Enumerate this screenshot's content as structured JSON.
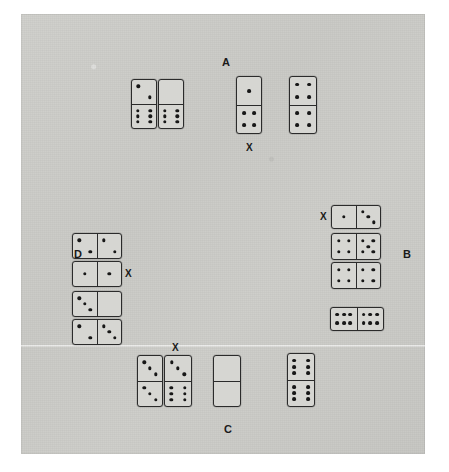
{
  "figure": {
    "background_color": "#c9c9c5",
    "tile_color": "#d6d6d2",
    "pip_color": "#171717",
    "border_color": "#2b2b2b"
  },
  "labels": [
    {
      "id": "label-a",
      "text": "A",
      "x": 222,
      "y": 57
    },
    {
      "id": "label-b",
      "text": "B",
      "x": 403,
      "y": 249
    },
    {
      "id": "label-c",
      "text": "C",
      "x": 224,
      "y": 424
    },
    {
      "id": "label-d",
      "text": "D",
      "x": 74,
      "y": 249
    }
  ],
  "x_marks": [
    {
      "id": "x-mark-a",
      "text": "X",
      "x": 246,
      "y": 143
    },
    {
      "id": "x-mark-b",
      "text": "X",
      "x": 320,
      "y": 212
    },
    {
      "id": "x-mark-c",
      "text": "X",
      "x": 172,
      "y": 343
    },
    {
      "id": "x-mark-d",
      "text": "X",
      "x": 125,
      "y": 269
    }
  ],
  "groups": [
    {
      "id": "group-a",
      "label": "A",
      "orientation": "vertical",
      "dominoes": [
        {
          "id": "a-1",
          "top": 2,
          "bottom": 6,
          "x": 131,
          "y": 79,
          "w": 26,
          "h": 50,
          "marked": false
        },
        {
          "id": "a-2",
          "top": 0,
          "bottom": 6,
          "x": 158,
          "y": 79,
          "w": 26,
          "h": 50,
          "marked": false
        },
        {
          "id": "a-3",
          "top": 1,
          "bottom": 4,
          "x": 236,
          "y": 76,
          "w": 26,
          "h": 58,
          "marked": true
        },
        {
          "id": "a-4",
          "top": 4,
          "bottom": 4,
          "x": 289,
          "y": 76,
          "w": 28,
          "h": 58,
          "marked": false
        }
      ]
    },
    {
      "id": "group-b",
      "label": "B",
      "orientation": "horizontal",
      "dominoes": [
        {
          "id": "b-1",
          "left": 1,
          "right": 3,
          "x": 331,
          "y": 205,
          "w": 50,
          "h": 24,
          "marked": true
        },
        {
          "id": "b-2",
          "left": 4,
          "right": 5,
          "x": 331,
          "y": 233,
          "w": 50,
          "h": 27,
          "marked": false
        },
        {
          "id": "b-3",
          "left": 4,
          "right": 4,
          "x": 331,
          "y": 262,
          "w": 50,
          "h": 27,
          "marked": false
        },
        {
          "id": "b-4",
          "left": 6,
          "right": 6,
          "x": 330,
          "y": 307,
          "w": 54,
          "h": 24,
          "marked": false
        }
      ]
    },
    {
      "id": "group-d",
      "label": "D",
      "orientation": "horizontal",
      "dominoes": [
        {
          "id": "d-1",
          "left": 2,
          "right": 2,
          "x": 72,
          "y": 233,
          "w": 50,
          "h": 26,
          "marked": false
        },
        {
          "id": "d-2",
          "left": 1,
          "right": 1,
          "x": 72,
          "y": 261,
          "w": 50,
          "h": 26,
          "marked": true
        },
        {
          "id": "d-3",
          "left": 3,
          "right": 0,
          "x": 72,
          "y": 291,
          "w": 50,
          "h": 26,
          "marked": false
        },
        {
          "id": "d-4",
          "left": 2,
          "right": 3,
          "x": 72,
          "y": 319,
          "w": 50,
          "h": 26,
          "marked": false
        }
      ]
    },
    {
      "id": "group-c",
      "label": "C",
      "orientation": "vertical",
      "dominoes": [
        {
          "id": "c-1",
          "top": 3,
          "bottom": 3,
          "x": 137,
          "y": 355,
          "w": 26,
          "h": 52,
          "marked": false
        },
        {
          "id": "c-2",
          "top": 3,
          "bottom": 6,
          "x": 164,
          "y": 355,
          "w": 28,
          "h": 52,
          "marked": true
        },
        {
          "id": "c-3",
          "top": 0,
          "bottom": 0,
          "x": 213,
          "y": 355,
          "w": 28,
          "h": 52,
          "marked": false
        },
        {
          "id": "c-4",
          "top": 6,
          "bottom": 6,
          "x": 287,
          "y": 353,
          "w": 28,
          "h": 54,
          "marked": false
        }
      ]
    }
  ]
}
